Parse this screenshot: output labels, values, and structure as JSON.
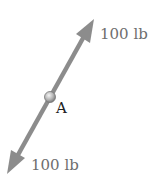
{
  "diagram": {
    "type": "force-diagram",
    "point": {
      "label": "A"
    },
    "forces": [
      {
        "label": "100 lb",
        "direction": "up-right"
      },
      {
        "label": "100 lb",
        "direction": "down-left"
      }
    ],
    "colors": {
      "arrow": "#8c8c8c",
      "label": "#6e6e6e",
      "point": "#b0b0b0"
    }
  }
}
